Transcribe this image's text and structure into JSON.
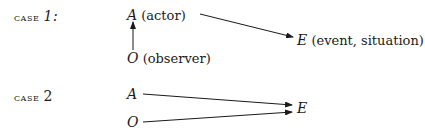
{
  "case1": {
    "label": "case",
    "number": "1:",
    "actor": {
      "symbol": "A",
      "desc": "(actor)"
    },
    "observer": {
      "symbol": "O",
      "desc": "(observer)"
    },
    "event": {
      "symbol": "E",
      "desc": "(event, situation)"
    }
  },
  "case2": {
    "label": "case",
    "number": "2",
    "actor": {
      "symbol": "A"
    },
    "observer": {
      "symbol": "O"
    },
    "event": {
      "symbol": "E"
    }
  }
}
